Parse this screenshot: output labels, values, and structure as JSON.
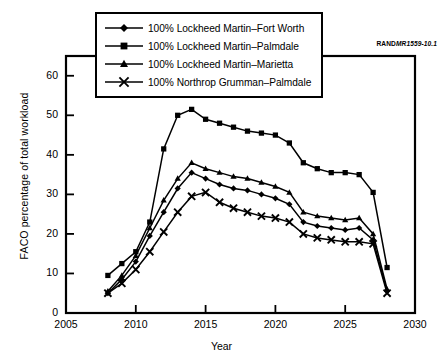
{
  "figure": {
    "rand_id_bold": "RAND",
    "rand_id_italic": "MR1559-10.1"
  },
  "chart_data": {
    "type": "line",
    "title": "",
    "xlabel": "Year",
    "ylabel": "FACO percentage of total workload",
    "xlim": [
      2005,
      2030
    ],
    "ylim": [
      0,
      65
    ],
    "xticks": [
      2005,
      2010,
      2015,
      2020,
      2025,
      2030
    ],
    "yticks": [
      0,
      10,
      20,
      30,
      40,
      50,
      60
    ],
    "grid": false,
    "legend_position": "top-center",
    "x": [
      2008,
      2009,
      2010,
      2011,
      2012,
      2013,
      2014,
      2015,
      2016,
      2017,
      2018,
      2019,
      2020,
      2021,
      2022,
      2023,
      2024,
      2025,
      2026,
      2027,
      2028
    ],
    "series": [
      {
        "name": "100% Lockheed Martin–Fort Worth",
        "marker": "diamond",
        "values": [
          5.0,
          8.5,
          13.0,
          19.5,
          25.5,
          31.5,
          35.5,
          34.0,
          32.5,
          31.5,
          31.0,
          30.0,
          29.0,
          27.5,
          23.0,
          22.0,
          21.5,
          21.0,
          21.5,
          18.5,
          5.5
        ]
      },
      {
        "name": "100% Lockheed Martin–Palmdale",
        "marker": "square",
        "values": [
          9.5,
          12.5,
          15.5,
          23.0,
          41.5,
          50.0,
          51.5,
          49.0,
          48.0,
          47.0,
          46.0,
          45.5,
          45.0,
          43.0,
          38.0,
          36.5,
          35.5,
          35.5,
          35.0,
          30.5,
          11.5
        ]
      },
      {
        "name": "100% Lockheed Martin–Marietta",
        "marker": "triangle",
        "values": [
          5.5,
          9.5,
          14.5,
          21.5,
          28.5,
          34.0,
          38.0,
          36.5,
          35.5,
          34.5,
          34.0,
          33.0,
          32.0,
          30.5,
          25.5,
          24.5,
          24.0,
          23.5,
          24.0,
          20.0,
          6.0
        ]
      },
      {
        "name": "100% Northrop Grumman–Palmdale",
        "marker": "cross",
        "values": [
          5.0,
          7.5,
          11.0,
          15.5,
          20.5,
          25.5,
          29.5,
          30.5,
          28.0,
          26.5,
          25.5,
          24.5,
          24.0,
          23.0,
          20.0,
          19.0,
          18.5,
          18.0,
          18.0,
          17.5,
          5.0
        ]
      }
    ]
  },
  "axis_labels": {
    "y": [
      "60",
      "50",
      "40",
      "30",
      "20",
      "10",
      "0"
    ],
    "x": [
      "2005",
      "2010",
      "2015",
      "2020",
      "2025",
      "2030"
    ]
  }
}
